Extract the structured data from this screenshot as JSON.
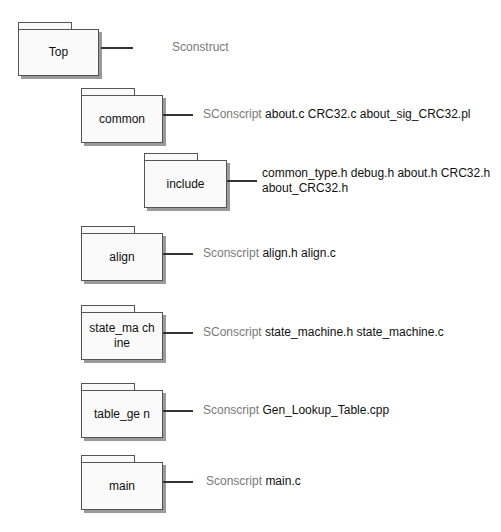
{
  "diagram": {
    "nodes": [
      {
        "id": "top",
        "label": "Top",
        "script": "Sconstruct",
        "files": ""
      },
      {
        "id": "common",
        "label": "common",
        "script": "SConscript",
        "files": "about.c  CRC32.c  about_sig_CRC32.pl"
      },
      {
        "id": "include",
        "label": "include",
        "script": "",
        "files_line1": "common_type.h debug.h about.h CRC32.h",
        "files_line2": "about_CRC32.h"
      },
      {
        "id": "align",
        "label": "align",
        "script": "Sconscript",
        "files": "align.h align.c"
      },
      {
        "id": "state_machine",
        "label": "state_ma chine",
        "script": "SConscript",
        "files": "state_machine.h state_machine.c"
      },
      {
        "id": "table_gen",
        "label": "table_ge n",
        "script": "Sconscript",
        "files": "Gen_Lookup_Table.cpp"
      },
      {
        "id": "main",
        "label": "main",
        "script": "Sconscript",
        "files": "main.c"
      }
    ],
    "caption": ""
  }
}
